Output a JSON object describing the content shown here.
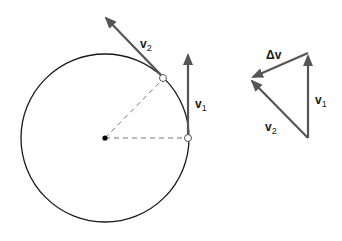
{
  "diagram": {
    "colors": {
      "circle": "#1a1a1a",
      "vector": "#555555",
      "dashed": "#777777",
      "center_dot": "#000000"
    },
    "circle": {
      "cx": 105,
      "cy": 138,
      "r": 84
    },
    "labels": {
      "v2_main": {
        "base": "v",
        "sub": "2"
      },
      "v1_main": {
        "base": "v",
        "sub": "1"
      },
      "delta_v": "Δv",
      "v1_triangle": {
        "base": "v",
        "sub": "1"
      },
      "v2_triangle": {
        "base": "v",
        "sub": "2"
      }
    }
  }
}
